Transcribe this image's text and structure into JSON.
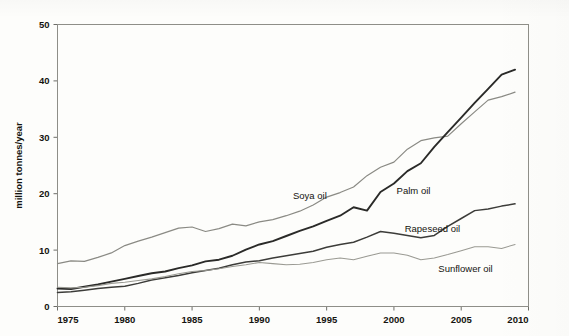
{
  "chart_data": {
    "type": "line",
    "title": "",
    "subtitle": "",
    "xlabel": "",
    "ylabel": "million tonnes/year",
    "xlim": [
      1975,
      2010
    ],
    "ylim": [
      0,
      50
    ],
    "grid": false,
    "legend_position": "inline-annotations",
    "xticks": [
      "1975",
      "1980",
      "1985",
      "1990",
      "1995",
      "2000",
      "2005",
      "2010"
    ],
    "xtick_values": [
      1975,
      1980,
      1985,
      1990,
      1995,
      2000,
      2005,
      2010
    ],
    "yticks": [
      "0",
      "10",
      "20",
      "30",
      "40",
      "50"
    ],
    "ytick_values": [
      0,
      10,
      20,
      30,
      40,
      50
    ],
    "x": [
      1975,
      1976,
      1977,
      1978,
      1979,
      1980,
      1981,
      1982,
      1983,
      1984,
      1985,
      1986,
      1987,
      1988,
      1989,
      1990,
      1991,
      1992,
      1993,
      1994,
      1995,
      1996,
      1997,
      1998,
      1999,
      2000,
      2001,
      2002,
      2003,
      2004,
      2005,
      2006,
      2007,
      2008,
      2009
    ],
    "series": [
      {
        "name": "Soya oil",
        "color": "#8a8a84",
        "label_x": 1992.5,
        "label_y": 19.0,
        "values": [
          7.6,
          8.1,
          8.0,
          8.7,
          9.5,
          10.8,
          11.6,
          12.3,
          13.1,
          13.9,
          14.1,
          13.3,
          13.8,
          14.6,
          14.3,
          15.0,
          15.4,
          16.1,
          16.9,
          18.0,
          19.4,
          20.2,
          21.2,
          23.2,
          24.7,
          25.6,
          27.9,
          29.4,
          29.9,
          30.2,
          32.4,
          34.5,
          36.6,
          37.2,
          38.0
        ]
      },
      {
        "name": "Palm oil",
        "color": "#2a2a28",
        "label_x": 2000.2,
        "label_y": 20.0,
        "values": [
          3.2,
          3.1,
          3.5,
          3.9,
          4.4,
          4.9,
          5.4,
          5.9,
          6.2,
          6.8,
          7.3,
          8.0,
          8.3,
          9.0,
          10.1,
          11.0,
          11.6,
          12.5,
          13.4,
          14.2,
          15.2,
          16.1,
          17.6,
          17.0,
          20.3,
          21.8,
          24.0,
          25.4,
          28.3,
          30.9,
          33.5,
          36.1,
          38.6,
          41.1,
          42.0
        ]
      },
      {
        "name": "Rapeseed oil",
        "color": "#3c3c39",
        "label_x": 2000.8,
        "label_y": 13.2,
        "values": [
          2.5,
          2.6,
          2.9,
          3.2,
          3.4,
          3.6,
          4.1,
          4.7,
          5.1,
          5.5,
          6.0,
          6.4,
          6.8,
          7.4,
          7.9,
          8.1,
          8.6,
          9.0,
          9.4,
          9.8,
          10.5,
          11.0,
          11.4,
          12.3,
          13.3,
          13.0,
          12.6,
          12.2,
          12.6,
          14.2,
          15.6,
          17.0,
          17.3,
          17.8,
          18.2
        ]
      },
      {
        "name": "Sunflower oil",
        "color": "#9a9a93",
        "label_x": 2003.3,
        "label_y": 6.2,
        "values": [
          3.4,
          3.3,
          3.4,
          3.7,
          4.1,
          4.3,
          4.6,
          4.9,
          5.3,
          5.8,
          6.2,
          6.4,
          6.7,
          7.1,
          7.4,
          7.8,
          7.6,
          7.4,
          7.5,
          7.8,
          8.3,
          8.6,
          8.3,
          8.9,
          9.5,
          9.5,
          9.1,
          8.3,
          8.6,
          9.2,
          9.9,
          10.6,
          10.6,
          10.3,
          11.0
        ]
      }
    ]
  }
}
